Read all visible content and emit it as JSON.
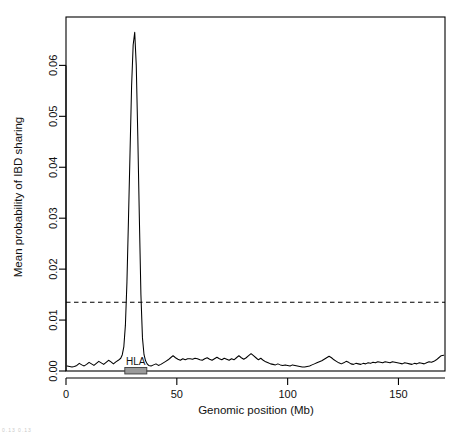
{
  "figure": {
    "background_color": "#ffffff",
    "line_color": "#000000",
    "threshold_color": "#000000",
    "hla_bar_color": "#9a9a9a",
    "corner_artifact": "0.13 0.13"
  },
  "chart_data": {
    "type": "line",
    "title": "",
    "xlabel": "Genomic position (Mb)",
    "ylabel": "Mean probability of IBD sharing",
    "xlim": [
      0,
      171
    ],
    "ylim": [
      0,
      0.0695
    ],
    "grid": false,
    "legend": "none",
    "xticks": [
      0,
      50,
      100,
      150
    ],
    "xtick_labels": [
      "0",
      "50",
      "100",
      "150"
    ],
    "yticks": [
      0.0,
      0.01,
      0.02,
      0.03,
      0.04,
      0.05,
      0.06
    ],
    "ytick_labels": [
      "0.00",
      "0.01",
      "0.02",
      "0.03",
      "0.04",
      "0.05",
      "0.06"
    ],
    "annotations": [
      {
        "name": "significance-threshold",
        "type": "hline",
        "y": 0.0135,
        "style": "dashed"
      },
      {
        "name": "hla-region",
        "type": "region-bar",
        "label": "HLA",
        "x_start": 29.5,
        "x_end": 33.5,
        "y": 0.0005
      }
    ],
    "series": [
      {
        "name": "Mean probability of IBD sharing",
        "x": [
          0.5,
          1.6,
          2.7,
          3.8,
          4.9,
          6.0,
          7.1,
          8.2,
          9.3,
          10.4,
          11.5,
          12.6,
          13.7,
          14.8,
          15.9,
          17.0,
          18.1,
          19.2,
          20.3,
          21.4,
          22.5,
          23.6,
          24.7,
          25.4,
          26.1,
          26.8,
          27.5,
          28.2,
          28.9,
          29.6,
          30.3,
          31.0,
          31.7,
          32.4,
          33.1,
          33.8,
          34.5,
          35.2,
          35.9,
          36.6,
          37.3,
          38.4,
          39.5,
          40.6,
          41.7,
          42.8,
          43.9,
          45.0,
          46.1,
          47.2,
          48.3,
          49.4,
          50.5,
          51.6,
          52.7,
          53.8,
          54.9,
          56.0,
          57.1,
          58.2,
          59.3,
          60.4,
          61.5,
          62.6,
          63.7,
          64.8,
          65.9,
          67.0,
          68.1,
          69.2,
          70.3,
          71.4,
          72.5,
          73.6,
          74.7,
          75.8,
          76.9,
          78.0,
          79.1,
          80.2,
          81.3,
          82.4,
          83.5,
          84.6,
          85.7,
          86.8,
          87.9,
          89.0,
          90.1,
          91.2,
          92.3,
          93.4,
          94.5,
          95.6,
          96.7,
          97.8,
          98.9,
          100.0,
          101.1,
          102.2,
          103.3,
          104.4,
          105.5,
          106.6,
          107.7,
          108.8,
          109.9,
          111.0,
          112.1,
          113.2,
          114.3,
          115.4,
          116.5,
          117.6,
          118.7,
          119.8,
          120.9,
          122.0,
          123.1,
          124.2,
          125.3,
          126.4,
          127.5,
          128.6,
          129.7,
          130.8,
          131.9,
          133.0,
          134.1,
          135.2,
          136.3,
          137.4,
          138.5,
          139.6,
          140.7,
          141.8,
          142.9,
          144.0,
          145.1,
          146.2,
          147.3,
          148.4,
          149.5,
          150.6,
          151.7,
          152.8,
          153.9,
          155.0,
          156.1,
          157.2,
          158.3,
          159.4,
          160.5,
          161.6,
          162.7,
          163.8,
          164.9,
          166.0,
          167.1,
          168.2,
          169.3,
          170.4
        ],
        "y": [
          0.001,
          0.0009,
          0.0008,
          0.0009,
          0.0011,
          0.0015,
          0.0012,
          0.001,
          0.0013,
          0.0017,
          0.0014,
          0.0011,
          0.0015,
          0.0019,
          0.0016,
          0.0013,
          0.0017,
          0.0021,
          0.0018,
          0.0014,
          0.0018,
          0.0021,
          0.0025,
          0.0032,
          0.0048,
          0.009,
          0.0175,
          0.03,
          0.043,
          0.056,
          0.064,
          0.0665,
          0.06,
          0.046,
          0.03,
          0.015,
          0.0065,
          0.0032,
          0.002,
          0.0014,
          0.0011,
          0.001,
          0.0012,
          0.0014,
          0.0011,
          0.0013,
          0.0016,
          0.0019,
          0.0022,
          0.0026,
          0.003,
          0.0026,
          0.0023,
          0.0021,
          0.0024,
          0.0022,
          0.0024,
          0.0024,
          0.0023,
          0.0025,
          0.0024,
          0.0022,
          0.0021,
          0.0024,
          0.0026,
          0.0023,
          0.0021,
          0.0024,
          0.0027,
          0.0024,
          0.0022,
          0.0025,
          0.0023,
          0.0021,
          0.0024,
          0.0022,
          0.0026,
          0.003,
          0.0026,
          0.0023,
          0.0026,
          0.003,
          0.0034,
          0.003,
          0.0026,
          0.0022,
          0.0025,
          0.0021,
          0.0018,
          0.0016,
          0.0014,
          0.0013,
          0.0012,
          0.0014,
          0.0012,
          0.0011,
          0.0012,
          0.0011,
          0.001,
          0.0012,
          0.0011,
          0.001,
          0.0009,
          0.0008,
          0.0008,
          0.0009,
          0.001,
          0.0012,
          0.0014,
          0.0016,
          0.0018,
          0.002,
          0.0023,
          0.0026,
          0.0029,
          0.0026,
          0.0022,
          0.0019,
          0.0016,
          0.0014,
          0.0016,
          0.0019,
          0.0017,
          0.0014,
          0.0013,
          0.0015,
          0.0014,
          0.0013,
          0.0015,
          0.0014,
          0.0016,
          0.0015,
          0.0017,
          0.0016,
          0.0018,
          0.0017,
          0.0016,
          0.0018,
          0.0017,
          0.0016,
          0.0018,
          0.0017,
          0.0016,
          0.0015,
          0.0014,
          0.0016,
          0.0015,
          0.0014,
          0.0013,
          0.0015,
          0.0014,
          0.0016,
          0.0015,
          0.0014,
          0.0016,
          0.0018,
          0.0017,
          0.0019,
          0.0022,
          0.0026,
          0.003,
          0.0031
        ]
      }
    ]
  }
}
